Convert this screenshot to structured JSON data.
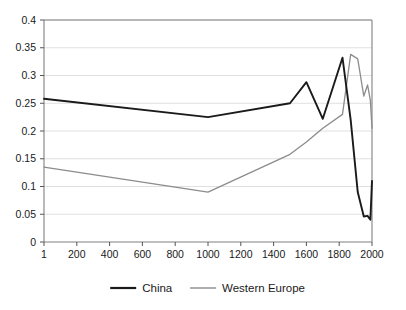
{
  "chart_data": {
    "type": "line",
    "title": "",
    "xlabel": "",
    "ylabel": "",
    "xlim": [
      1,
      2000
    ],
    "ylim": [
      0,
      0.4
    ],
    "grid": true,
    "legend_position": "bottom",
    "x_tick_labels": [
      "1",
      "200",
      "400",
      "600",
      "800",
      "1000",
      "1200",
      "1400",
      "1600",
      "1800",
      "2000"
    ],
    "x_tick_values": [
      1,
      200,
      400,
      600,
      800,
      1000,
      1200,
      1400,
      1600,
      1800,
      2000
    ],
    "y_tick_labels": [
      "0",
      "0.05",
      "0.1",
      "0.15",
      "0.2",
      "0.25",
      "0.3",
      "0.35",
      "0.4"
    ],
    "y_tick_values": [
      0,
      0.05,
      0.1,
      0.15,
      0.2,
      0.25,
      0.3,
      0.35,
      0.4
    ],
    "series": [
      {
        "name": "China",
        "color": "#1a1a1a",
        "x": [
          1,
          1000,
          1500,
          1600,
          1700,
          1820,
          1870,
          1913,
          1950,
          1973,
          1990,
          2000
        ],
        "values": [
          0.258,
          0.225,
          0.25,
          0.288,
          0.222,
          0.332,
          0.22,
          0.09,
          0.046,
          0.047,
          0.04,
          0.11
        ]
      },
      {
        "name": "Western Europe",
        "color": "#8c8c8c",
        "x": [
          1,
          1000,
          1500,
          1600,
          1700,
          1820,
          1870,
          1913,
          1950,
          1973,
          1990,
          2000
        ],
        "values": [
          0.135,
          0.09,
          0.158,
          0.18,
          0.205,
          0.23,
          0.338,
          0.33,
          0.263,
          0.283,
          0.255,
          0.205
        ]
      }
    ]
  },
  "legend": {
    "entries": [
      {
        "label": "China",
        "color": "#1a1a1a"
      },
      {
        "label": "Western Europe",
        "color": "#8c8c8c"
      }
    ]
  }
}
